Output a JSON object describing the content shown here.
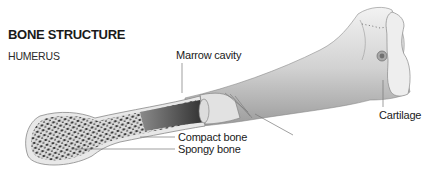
{
  "header": {
    "title": "BONE STRUCTURE",
    "subtitle": "HUMERUS"
  },
  "labels": {
    "marrow_cavity": "Marrow cavity",
    "compact_bone": "Compact bone",
    "spongy_bone": "Spongy bone",
    "cartilage": "Cartilage"
  },
  "colors": {
    "background": "#ffffff",
    "bone_light": "#e6e6e6",
    "bone_mid": "#c4c4c4",
    "bone_dark": "#7a7a7a",
    "marrow": "#3a3a3a",
    "cartilage": "#ececec",
    "leader_line": "#777777",
    "text": "#1a1a1a"
  }
}
